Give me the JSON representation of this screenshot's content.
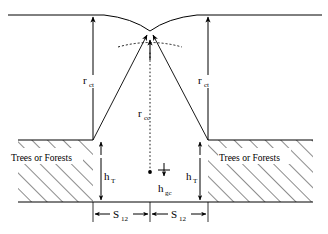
{
  "figure": {
    "kind": "geometry-diagram"
  },
  "labels": {
    "r_ct_left": {
      "base": "r",
      "sub": "ct"
    },
    "r_ct_right": {
      "base": "r",
      "sub": "ct"
    },
    "r_cc_center": {
      "base": "r",
      "sub": "cc"
    },
    "h_T_left": {
      "base": "h",
      "sub": "T"
    },
    "h_T_right": {
      "base": "h",
      "sub": "T"
    },
    "h_gc_center": {
      "base": "h",
      "sub": "gc"
    },
    "s12_left": {
      "base": "S",
      "sub": "12"
    },
    "s12_right": {
      "base": "S",
      "sub": "12"
    },
    "region_left": "Trees or Forests",
    "region_right": "Trees or Forests"
  },
  "colors": {
    "stroke": "#000000",
    "background": "#ffffff",
    "hatch": "#000000"
  },
  "geometry": {
    "top_line_y": 15,
    "canopy_top_y": 140,
    "ground_y": 202,
    "left_tree_x": 93,
    "right_tree_x": 208,
    "center_x": 150,
    "apex_x": 150,
    "apex_y": 30,
    "ground_center_point_y": 172
  }
}
